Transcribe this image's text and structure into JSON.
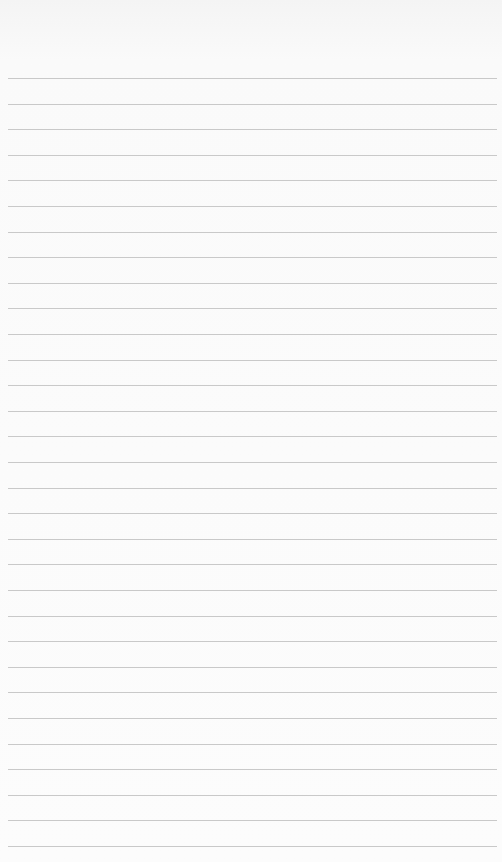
{
  "paper": {
    "kind": "lined-notepaper",
    "background_color": "#fbfbfb",
    "rule_color": "#c9c9c9",
    "rule_count": 31,
    "first_rule_y": 78,
    "rule_spacing": 25.6
  }
}
